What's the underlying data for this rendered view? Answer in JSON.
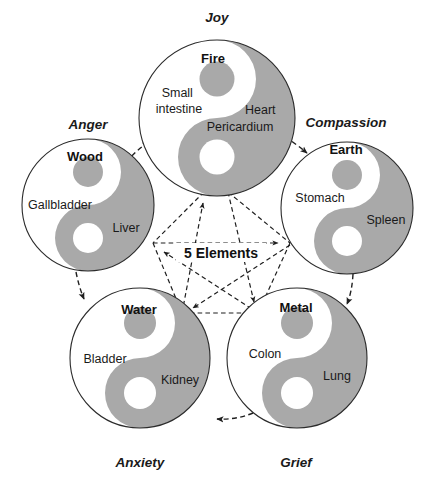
{
  "diagram": {
    "title": "5 Elements",
    "center_label": "5 Elements",
    "colors": {
      "background": "#ffffff",
      "yin_gray": "#a9a9a9",
      "outline": "#2b2b2b",
      "text": "#1a1a1a",
      "arrow": "#1f1f1f"
    },
    "elements": [
      {
        "id": "fire",
        "element": "Fire",
        "emotion": "Joy",
        "yin_organ": "Small\nintestine",
        "yin_organ_lines": [
          "Small",
          "intestine"
        ],
        "yang_organ_lines": [
          "Heart",
          "Pericardium"
        ],
        "cx": 217,
        "cy": 118,
        "r": 78,
        "emotion_x": 217,
        "emotion_y": 22,
        "element_x": 213,
        "element_y": 63,
        "yin_x": 179,
        "yin_y": 97,
        "yang_x": 258,
        "yang_y": 114
      },
      {
        "id": "wood",
        "element": "Wood",
        "emotion": "Anger",
        "yin_organ_lines": [
          "Gallbladder"
        ],
        "yang_organ_lines": [
          "Liver"
        ],
        "cx": 88,
        "cy": 205,
        "r": 66,
        "emotion_x": 88,
        "emotion_y": 129,
        "element_x": 85,
        "element_y": 160,
        "yin_x": 61,
        "yin_y": 205,
        "yang_x": 124,
        "yang_y": 229
      },
      {
        "id": "earth",
        "element": "Earth",
        "emotion": "Compassion",
        "yin_organ_lines": [
          "Stomach"
        ],
        "yang_organ_lines": [
          "Spleen"
        ],
        "cx": 347,
        "cy": 208,
        "r": 66,
        "emotion_x": 346,
        "emotion_y": 126,
        "element_x": 346,
        "element_y": 153,
        "yin_x": 318,
        "yin_y": 198,
        "yang_x": 384,
        "yang_y": 219
      },
      {
        "id": "water",
        "element": "Water",
        "emotion": "Anxiety",
        "yin_organ_lines": [
          "Bladder"
        ],
        "yang_organ_lines": [
          "Kidney"
        ],
        "cx": 140,
        "cy": 358,
        "r": 70,
        "emotion_x": 140,
        "emotion_y": 466,
        "element_x": 139,
        "element_y": 313,
        "yin_x": 104,
        "yin_y": 359,
        "yang_x": 178,
        "yang_y": 380
      },
      {
        "id": "metal",
        "element": "Metal",
        "emotion": "Grief",
        "yin_organ_lines": [
          "Colon"
        ],
        "yang_organ_lines": [
          "Lung"
        ],
        "cx": 297,
        "cy": 358,
        "r": 70,
        "emotion_x": 296,
        "emotion_y": 466,
        "element_x": 296,
        "element_y": 311,
        "yin_x": 264,
        "yin_y": 354,
        "yang_x": 335,
        "yang_y": 376
      }
    ],
    "generating_cycle": [
      {
        "from": "wood",
        "to": "fire"
      },
      {
        "from": "fire",
        "to": "earth"
      },
      {
        "from": "earth",
        "to": "metal"
      },
      {
        "from": "metal",
        "to": "water"
      },
      {
        "from": "water",
        "to": "wood"
      }
    ],
    "controlling_cycle": [
      {
        "from": "wood",
        "to": "earth"
      },
      {
        "from": "earth",
        "to": "water"
      },
      {
        "from": "water",
        "to": "fire"
      },
      {
        "from": "fire",
        "to": "metal"
      },
      {
        "from": "metal",
        "to": "wood"
      }
    ]
  }
}
